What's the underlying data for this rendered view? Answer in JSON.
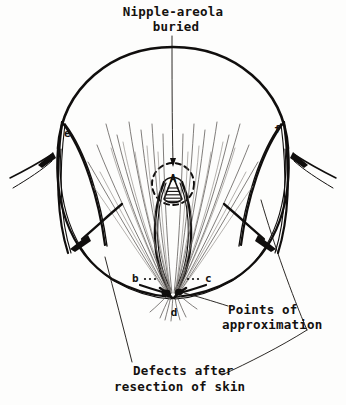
{
  "figure": {
    "kind": "surgical-diagram",
    "background_color": "#fdfdfc",
    "ink_color": "#100e0d"
  },
  "annotations": {
    "title_line1": "Nipple-areola",
    "title_line2": "buried",
    "points_line1": "Points of",
    "points_line2": "approximation",
    "defects_line1": "Defects after",
    "defects_line2": "resection of skin"
  },
  "point_labels": {
    "a": "A",
    "b": "b",
    "c": "c",
    "d": "d",
    "e": "e",
    "f": "f"
  }
}
